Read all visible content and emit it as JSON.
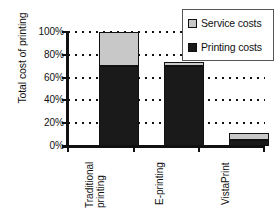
{
  "chart_data": {
    "type": "bar",
    "subtype": "stacked-bar",
    "title": "",
    "xlabel": "",
    "ylabel": "Total cost of printing",
    "categories": [
      "Traditional printing",
      "E-printing",
      "VistaPrint"
    ],
    "category_lines": [
      [
        "Traditional",
        "printing"
      ],
      [
        "E-printing"
      ],
      [
        "VistaPrint"
      ]
    ],
    "series": [
      {
        "name": "Printing costs",
        "color": "#1a1a1a",
        "values": [
          70,
          70,
          5
        ]
      },
      {
        "name": "Service costs",
        "color": "#c8c8c8",
        "values": [
          30,
          4,
          6
        ]
      }
    ],
    "totals": [
      100,
      74,
      11
    ],
    "ylim": [
      0,
      100
    ],
    "yticks": [
      0,
      20,
      40,
      60,
      80,
      100
    ],
    "ytick_labels": [
      "0%",
      "20%",
      "40%",
      "60%",
      "80%",
      "100%"
    ],
    "unit": "%",
    "grid": true,
    "grid_axis": "y",
    "grid_style": "dotted",
    "legend_position": "top-right",
    "legend_entries": [
      {
        "label": "Service costs",
        "color": "#c8c8c8"
      },
      {
        "label": "Printing costs",
        "color": "#1a1a1a"
      }
    ]
  },
  "axis": {
    "y_title": "Total cost of printing",
    "tick_labels": [
      "100%",
      "80%",
      "60%",
      "40%",
      "20%",
      "0%"
    ]
  },
  "legend": {
    "service_label": "Service costs",
    "printing_label": "Printing costs"
  },
  "bars": {
    "traditional": {
      "line1": "Traditional",
      "line2": "printing"
    },
    "eprinting": {
      "line1": "E-printing"
    },
    "vistaprint": {
      "line1": "VistaPrint"
    }
  }
}
